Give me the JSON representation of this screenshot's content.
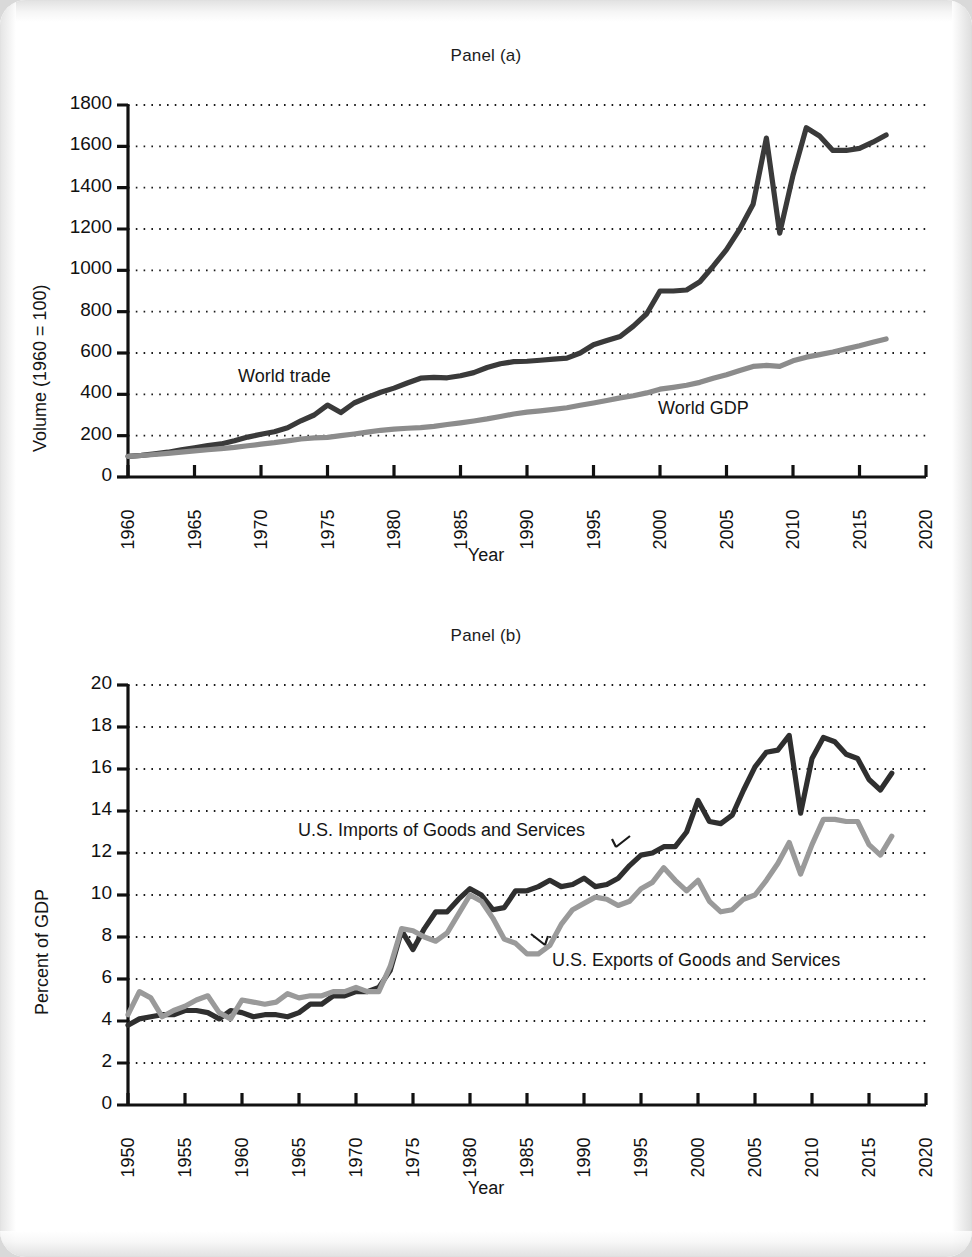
{
  "figure": {
    "background_color": "#ffffff",
    "page_edge_color": "#d9d9d9"
  },
  "panel_a": {
    "title": "Panel (a)",
    "ylabel": "Volume (1960 = 100)",
    "xlabel": "Year",
    "yticks": [
      "0",
      "200",
      "400",
      "600",
      "800",
      "1000",
      "1200",
      "1400",
      "1600",
      "1800"
    ],
    "xticks": [
      "1960",
      "1965",
      "1970",
      "1975",
      "1980",
      "1985",
      "1990",
      "1995",
      "2000",
      "2005",
      "2010",
      "2015",
      "2020"
    ],
    "series_label_trade": "World trade",
    "series_label_gdp": "World GDP",
    "color_trade": "#3a3a3a",
    "color_gdp": "#8c8c8c"
  },
  "panel_b": {
    "title": "Panel (b)",
    "ylabel": "Percent of GDP",
    "xlabel": "Year",
    "yticks": [
      "0",
      "2",
      "4",
      "6",
      "8",
      "10",
      "12",
      "14",
      "16",
      "18",
      "20"
    ],
    "xticks": [
      "1950",
      "1955",
      "1960",
      "1965",
      "1970",
      "1975",
      "1980",
      "1985",
      "1990",
      "1995",
      "2000",
      "2005",
      "2010",
      "2015",
      "2020"
    ],
    "series_label_imports": "U.S. Imports of Goods and Services",
    "series_label_exports": "U.S. Exports of Goods and Services",
    "color_imports": "#2f2f2f",
    "color_exports": "#9a9a9a"
  },
  "chart_data": [
    {
      "type": "line",
      "title": "Panel (a)",
      "xlabel": "Year",
      "ylabel": "Volume (1960 = 100)",
      "xlim": [
        1960,
        2020
      ],
      "ylim": [
        0,
        1800
      ],
      "grid": true,
      "legend": "inline-annotations",
      "x": [
        1960,
        1961,
        1962,
        1963,
        1964,
        1965,
        1966,
        1967,
        1968,
        1969,
        1970,
        1971,
        1972,
        1973,
        1974,
        1975,
        1976,
        1977,
        1978,
        1979,
        1980,
        1981,
        1982,
        1983,
        1984,
        1985,
        1986,
        1987,
        1988,
        1989,
        1990,
        1991,
        1992,
        1993,
        1994,
        1995,
        1996,
        1997,
        1998,
        1999,
        2000,
        2001,
        2002,
        2003,
        2004,
        2005,
        2006,
        2007,
        2008,
        2009,
        2010,
        2011,
        2012,
        2013,
        2014,
        2015,
        2016,
        2017
      ],
      "series": [
        {
          "name": "World trade",
          "color": "#3a3a3a",
          "values": [
            100,
            105,
            112,
            120,
            131,
            141,
            152,
            160,
            175,
            193,
            207,
            219,
            238,
            272,
            300,
            348,
            312,
            358,
            385,
            410,
            430,
            455,
            478,
            482,
            480,
            490,
            505,
            530,
            548,
            558,
            560,
            565,
            570,
            575,
            600,
            640,
            660,
            680,
            730,
            790,
            900,
            900,
            905,
            945,
            1020,
            1100,
            1200,
            1320,
            1640,
            1180,
            1460,
            1690,
            1650,
            1580,
            1580,
            1590,
            1620,
            1655
          ]
        },
        {
          "name": "World GDP",
          "color": "#8c8c8c",
          "values": [
            100,
            104,
            109,
            114,
            120,
            126,
            132,
            137,
            143,
            151,
            159,
            166,
            175,
            184,
            189,
            192,
            200,
            208,
            217,
            226,
            232,
            236,
            239,
            245,
            254,
            262,
            271,
            281,
            293,
            305,
            314,
            320,
            327,
            335,
            347,
            358,
            370,
            383,
            393,
            407,
            425,
            434,
            444,
            458,
            478,
            495,
            515,
            535,
            540,
            535,
            562,
            580,
            592,
            605,
            620,
            635,
            652,
            668
          ]
        }
      ]
    },
    {
      "type": "line",
      "title": "Panel (b)",
      "xlabel": "Year",
      "ylabel": "Percent of GDP",
      "xlim": [
        1950,
        2020
      ],
      "ylim": [
        0,
        20
      ],
      "grid": true,
      "legend": "inline-annotations",
      "x": [
        1950,
        1951,
        1952,
        1953,
        1954,
        1955,
        1956,
        1957,
        1958,
        1959,
        1960,
        1961,
        1962,
        1963,
        1964,
        1965,
        1966,
        1967,
        1968,
        1969,
        1970,
        1971,
        1972,
        1973,
        1974,
        1975,
        1976,
        1977,
        1978,
        1979,
        1980,
        1981,
        1982,
        1983,
        1984,
        1985,
        1986,
        1987,
        1988,
        1989,
        1990,
        1991,
        1992,
        1993,
        1994,
        1995,
        1996,
        1997,
        1998,
        1999,
        2000,
        2001,
        2002,
        2003,
        2004,
        2005,
        2006,
        2007,
        2008,
        2009,
        2010,
        2011,
        2012,
        2013,
        2014,
        2015,
        2016,
        2017
      ],
      "series": [
        {
          "name": "U.S. Imports of Goods and Services",
          "color": "#2f2f2f",
          "values": [
            3.8,
            4.1,
            4.2,
            4.3,
            4.3,
            4.5,
            4.5,
            4.4,
            4.1,
            4.5,
            4.4,
            4.2,
            4.3,
            4.3,
            4.2,
            4.4,
            4.8,
            4.8,
            5.2,
            5.2,
            5.4,
            5.4,
            5.6,
            6.4,
            8.3,
            7.4,
            8.4,
            9.2,
            9.2,
            9.8,
            10.3,
            10.0,
            9.3,
            9.4,
            10.2,
            10.2,
            10.4,
            10.7,
            10.4,
            10.5,
            10.8,
            10.4,
            10.5,
            10.8,
            11.4,
            11.9,
            12.0,
            12.3,
            12.3,
            13.0,
            14.5,
            13.5,
            13.4,
            13.8,
            15.0,
            16.1,
            16.8,
            16.9,
            17.6,
            13.9,
            16.5,
            17.5,
            17.3,
            16.7,
            16.5,
            15.5,
            15.0,
            15.8
          ]
        },
        {
          "name": "U.S. Exports of Goods and Services",
          "color": "#9a9a9a",
          "values": [
            4.3,
            5.4,
            5.1,
            4.2,
            4.5,
            4.7,
            5.0,
            5.2,
            4.4,
            4.1,
            5.0,
            4.9,
            4.8,
            4.9,
            5.3,
            5.1,
            5.2,
            5.2,
            5.4,
            5.4,
            5.6,
            5.4,
            5.4,
            6.6,
            8.4,
            8.3,
            8.0,
            7.8,
            8.2,
            9.1,
            10.0,
            9.7,
            8.9,
            7.9,
            7.7,
            7.2,
            7.2,
            7.6,
            8.6,
            9.3,
            9.6,
            9.9,
            9.8,
            9.5,
            9.7,
            10.3,
            10.6,
            11.3,
            10.7,
            10.2,
            10.7,
            9.7,
            9.2,
            9.3,
            9.8,
            10.0,
            10.7,
            11.5,
            12.5,
            11.0,
            12.4,
            13.6,
            13.6,
            13.5,
            13.5,
            12.4,
            11.9,
            12.8
          ]
        }
      ]
    }
  ]
}
